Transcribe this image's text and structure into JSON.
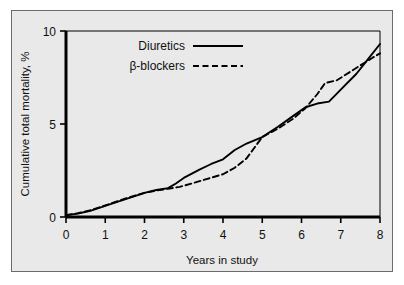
{
  "figure": {
    "background_color": "#ffffff",
    "panel_color": "#e9e9e9",
    "panel_border_color": "#6b6b6b",
    "axis_color": "#000000"
  },
  "chart_data": {
    "type": "line",
    "title": "",
    "xlabel": "Years in study",
    "ylabel": "Cumulative total mortality, %",
    "xlim": [
      0,
      8
    ],
    "ylim": [
      0,
      10
    ],
    "xticks": [
      0,
      1,
      2,
      3,
      4,
      5,
      6,
      7,
      8
    ],
    "xtick_labels": [
      "0",
      "1",
      "2",
      "3",
      "4",
      "5",
      "6",
      "7",
      "8"
    ],
    "yticks": [
      0,
      5,
      10
    ],
    "ytick_labels": [
      "0",
      "5",
      "10"
    ],
    "grid": false,
    "legend_position": "upper left",
    "series": [
      {
        "name": "Diuretics",
        "linestyle": "solid",
        "color": "#000000",
        "x": [
          0,
          0.3,
          0.6,
          1.0,
          1.5,
          2.0,
          2.3,
          2.6,
          2.8,
          3.0,
          3.4,
          3.7,
          4.0,
          4.3,
          4.6,
          5.0,
          5.4,
          5.8,
          6.1,
          6.4,
          6.7,
          7.0,
          7.4,
          7.7,
          8.0
        ],
        "y": [
          0.1,
          0.18,
          0.32,
          0.6,
          0.95,
          1.3,
          1.45,
          1.55,
          1.8,
          2.1,
          2.55,
          2.85,
          3.1,
          3.6,
          3.95,
          4.3,
          4.85,
          5.45,
          5.9,
          6.1,
          6.2,
          6.85,
          7.7,
          8.5,
          9.3
        ]
      },
      {
        "name": "β-blockers",
        "linestyle": "dashed",
        "color": "#000000",
        "x": [
          0,
          0.3,
          0.6,
          1.0,
          1.5,
          2.0,
          2.3,
          2.6,
          2.9,
          3.2,
          3.6,
          4.0,
          4.3,
          4.6,
          5.0,
          5.4,
          5.8,
          6.1,
          6.4,
          6.6,
          6.9,
          7.2,
          7.5,
          7.8,
          8.0
        ],
        "y": [
          0.1,
          0.2,
          0.35,
          0.62,
          0.98,
          1.3,
          1.42,
          1.52,
          1.62,
          1.8,
          2.05,
          2.3,
          2.65,
          3.15,
          4.3,
          4.75,
          5.3,
          5.85,
          6.6,
          7.2,
          7.35,
          7.75,
          8.15,
          8.55,
          8.8
        ]
      }
    ],
    "legend": [
      {
        "label": "Diuretics",
        "linestyle": "solid"
      },
      {
        "label": "β-blockers",
        "linestyle": "dashed"
      }
    ]
  }
}
